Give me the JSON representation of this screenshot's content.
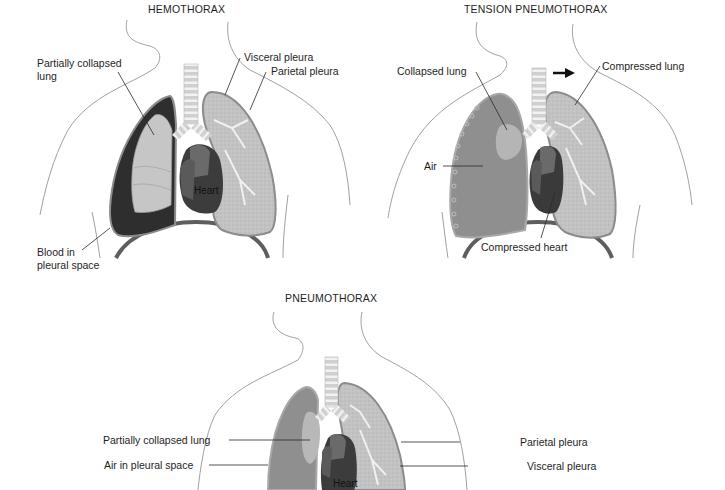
{
  "panels": {
    "hemothorax": {
      "title": "HEMOTHORAX",
      "labels": {
        "partially_collapsed_lung_1": "Partially collapsed",
        "partially_collapsed_lung_2": "lung",
        "visceral_pleura": "Visceral pleura",
        "parietal_pleura": "Parietal pleura",
        "heart": "Heart",
        "blood_1": "Blood in",
        "blood_2": "pleural space"
      }
    },
    "tension_pneumothorax": {
      "title": "TENSION PNEUMOTHORAX",
      "labels": {
        "collapsed_lung": "Collapsed lung",
        "compressed_lung": "Compressed lung",
        "air": "Air",
        "compressed_heart": "Compressed heart"
      },
      "arrow": "mediastinal-shift-arrow"
    },
    "pneumothorax": {
      "title": "PNEUMOTHORAX",
      "labels": {
        "partially_collapsed_lung": "Partially collapsed lung",
        "air_in_pleural_space": "Air in pleural space",
        "parietal_pleura": "Parietal pleura",
        "visceral_pleura": "Visceral pleura",
        "heart": "Heart"
      }
    }
  },
  "colors": {
    "background": "#ffffff",
    "outline": "#9a9a9a",
    "blood": "#2e2e2e",
    "lung_tissue": "#c4c4c4",
    "collapsed_lung": "#bdbdbd",
    "air_space": "#8f8f8f",
    "heart_dark": "#3c3c3c",
    "heart_mid": "#6a6a6a",
    "diaphragm": "#5a5a5a",
    "trachea_light": "#d8d8d8",
    "trachea_band": "#ffffff",
    "text": "#1e1e1e"
  }
}
